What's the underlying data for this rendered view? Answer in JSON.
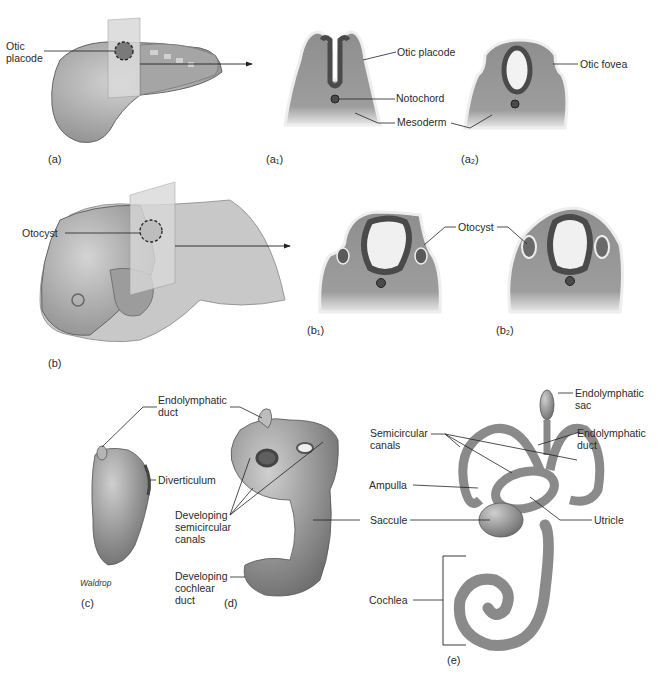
{
  "figure": {
    "panels": {
      "a": "(a)",
      "a1": "(a₁)",
      "a2": "(a₂)",
      "b": "(b)",
      "b1": "(b₁)",
      "b2": "(b₂)",
      "c": "(c)",
      "d": "(d)",
      "e": "(e)"
    },
    "labels": {
      "a_otic_placode": "Otic\nplacode",
      "a1_otic_placode": "Otic placode",
      "a1_notochord": "Notochord",
      "a1_mesoderm": "Mesoderm",
      "a2_otic_fovea": "Otic fovea",
      "b_otocyst": "Otocyst",
      "b1_otocyst": "Otocyst",
      "c_endolymphatic_duct": "Endolymphatic\nduct",
      "c_diverticulum": "Diverticulum",
      "d_semicircular": "Developing\nsemicircular\ncanals",
      "d_cochlear": "Developing\ncochlear\nduct",
      "e_endolymphatic_sac": "Endolymphatic\nsac",
      "e_semicircular": "Semicircular\ncanals",
      "e_endolymphatic_duct": "Endolymphatic\nduct",
      "e_ampulla": "Ampulla",
      "e_saccule": "Saccule",
      "e_utricle": "Utricle",
      "e_cochlea": "Cochlea"
    },
    "credit": "Waldrop",
    "colors": {
      "tissue": "#9a9a9a",
      "tissue_dark": "#5e5e5e",
      "ectoderm": "#e8e8e8",
      "embryo": "#b5b5b5",
      "plane": "#d9d9d9",
      "line": "#222222"
    }
  }
}
